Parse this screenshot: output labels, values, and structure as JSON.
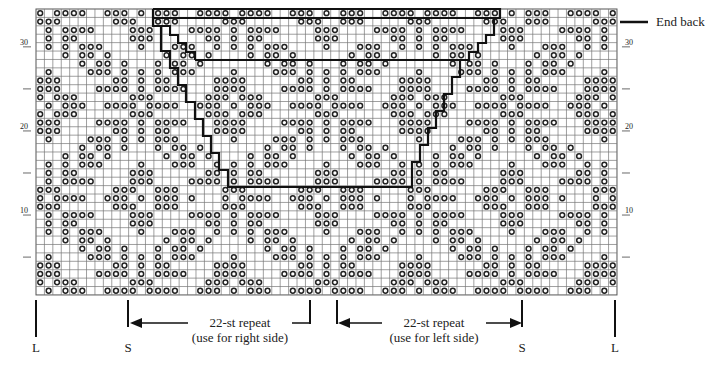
{
  "chart_title": "",
  "grid": {
    "left": 36,
    "top": 9,
    "cell_w": 8.42,
    "cell_h": 8.41,
    "cols": 69,
    "rows": 34,
    "repeat_width": 22,
    "symbol": "o",
    "line_color": "#555555",
    "symbol_color": "#222222"
  },
  "pattern_rows_top_to_bottom": [
    "1011110011101011100111",
    "1110000001110011100000",
    "0101111000011100001111",
    "0101100000011100000011",
    "0101011100001000111001",
    "0001011010000001011010",
    "0000010110100010110100",
    "0100001110101010111000",
    "1110000001101011000001",
    "1110000111101011110001",
    "1011100000011100000011",
    "0101110011110111100111",
    "1011100000011100000011",
    "1110000111101011110001",
    "1110000001101011000001",
    "0100001110101011100000",
    "0000010110100010110100",
    "0001011010000001011010",
    "0101011100001000111001",
    "0101100000011100000011",
    "0101111000011100001111",
    "1110000001110011100000",
    "1011110011101011101000",
    "1110000001110011100000",
    "0101111000011100001111",
    "0101100000011100000011",
    "0101011100001000111001",
    "0001011010000001011010",
    "0000010110100010110100",
    "0100001110101010111000",
    "1110000001101011000001",
    "1110000111101011110001",
    "1011100000011100000011",
    "0101110011110111100111"
  ],
  "row_numbers": [
    {
      "label": "10",
      "row_from_bottom": 10
    },
    {
      "label": "20",
      "row_from_bottom": 20
    },
    {
      "label": "30",
      "row_from_bottom": 30
    }
  ],
  "row_ticks_from_bottom": [
    5,
    10,
    15,
    20,
    25,
    30
  ],
  "annotations": {
    "end_back": "End back",
    "repeat_right": {
      "line1": "22-st repeat",
      "line2": "(use for right side)"
    },
    "repeat_left": {
      "line1": "22-st repeat",
      "line2": "(use for left side)"
    },
    "markers": [
      {
        "label": "L",
        "x": 36
      },
      {
        "label": "S",
        "x": 128
      },
      {
        "label": "S",
        "x": 522
      },
      {
        "label": "L",
        "x": 615
      }
    ]
  },
  "outline": {
    "outer_path": [
      [
        153,
        9
      ],
      [
        500,
        9
      ],
      [
        500,
        18
      ],
      [
        494,
        18
      ],
      [
        494,
        35
      ],
      [
        486,
        35
      ],
      [
        486,
        43
      ],
      [
        478,
        43
      ],
      [
        478,
        52
      ],
      [
        469,
        52
      ],
      [
        469,
        60
      ],
      [
        460,
        60
      ],
      [
        460,
        77
      ],
      [
        452,
        77
      ],
      [
        452,
        94
      ],
      [
        444,
        94
      ],
      [
        444,
        111
      ],
      [
        436,
        111
      ],
      [
        436,
        128
      ],
      [
        428,
        128
      ],
      [
        428,
        145
      ],
      [
        420,
        145
      ],
      [
        420,
        162
      ],
      [
        412,
        162
      ],
      [
        412,
        187
      ],
      [
        228,
        187
      ],
      [
        228,
        170
      ],
      [
        219,
        170
      ],
      [
        219,
        153
      ],
      [
        211,
        153
      ],
      [
        211,
        136
      ],
      [
        203,
        136
      ],
      [
        203,
        119
      ],
      [
        195,
        119
      ],
      [
        195,
        102
      ],
      [
        186,
        102
      ],
      [
        186,
        85
      ],
      [
        178,
        85
      ],
      [
        178,
        68
      ],
      [
        170,
        68
      ],
      [
        170,
        51
      ],
      [
        161,
        51
      ],
      [
        161,
        26
      ],
      [
        153,
        26
      ],
      [
        153,
        9
      ]
    ],
    "inner_top_line": [
      [
        153,
        18
      ],
      [
        500,
        18
      ]
    ],
    "inner_mid_line": [
      [
        195,
        60
      ],
      [
        460,
        60
      ]
    ],
    "inner_left_steps": [
      [
        161,
        26
      ],
      [
        170,
        26
      ],
      [
        170,
        35
      ],
      [
        178,
        35
      ],
      [
        178,
        43
      ],
      [
        186,
        43
      ],
      [
        186,
        52
      ],
      [
        195,
        52
      ],
      [
        195,
        60
      ]
    ],
    "stroke": "#111111"
  }
}
